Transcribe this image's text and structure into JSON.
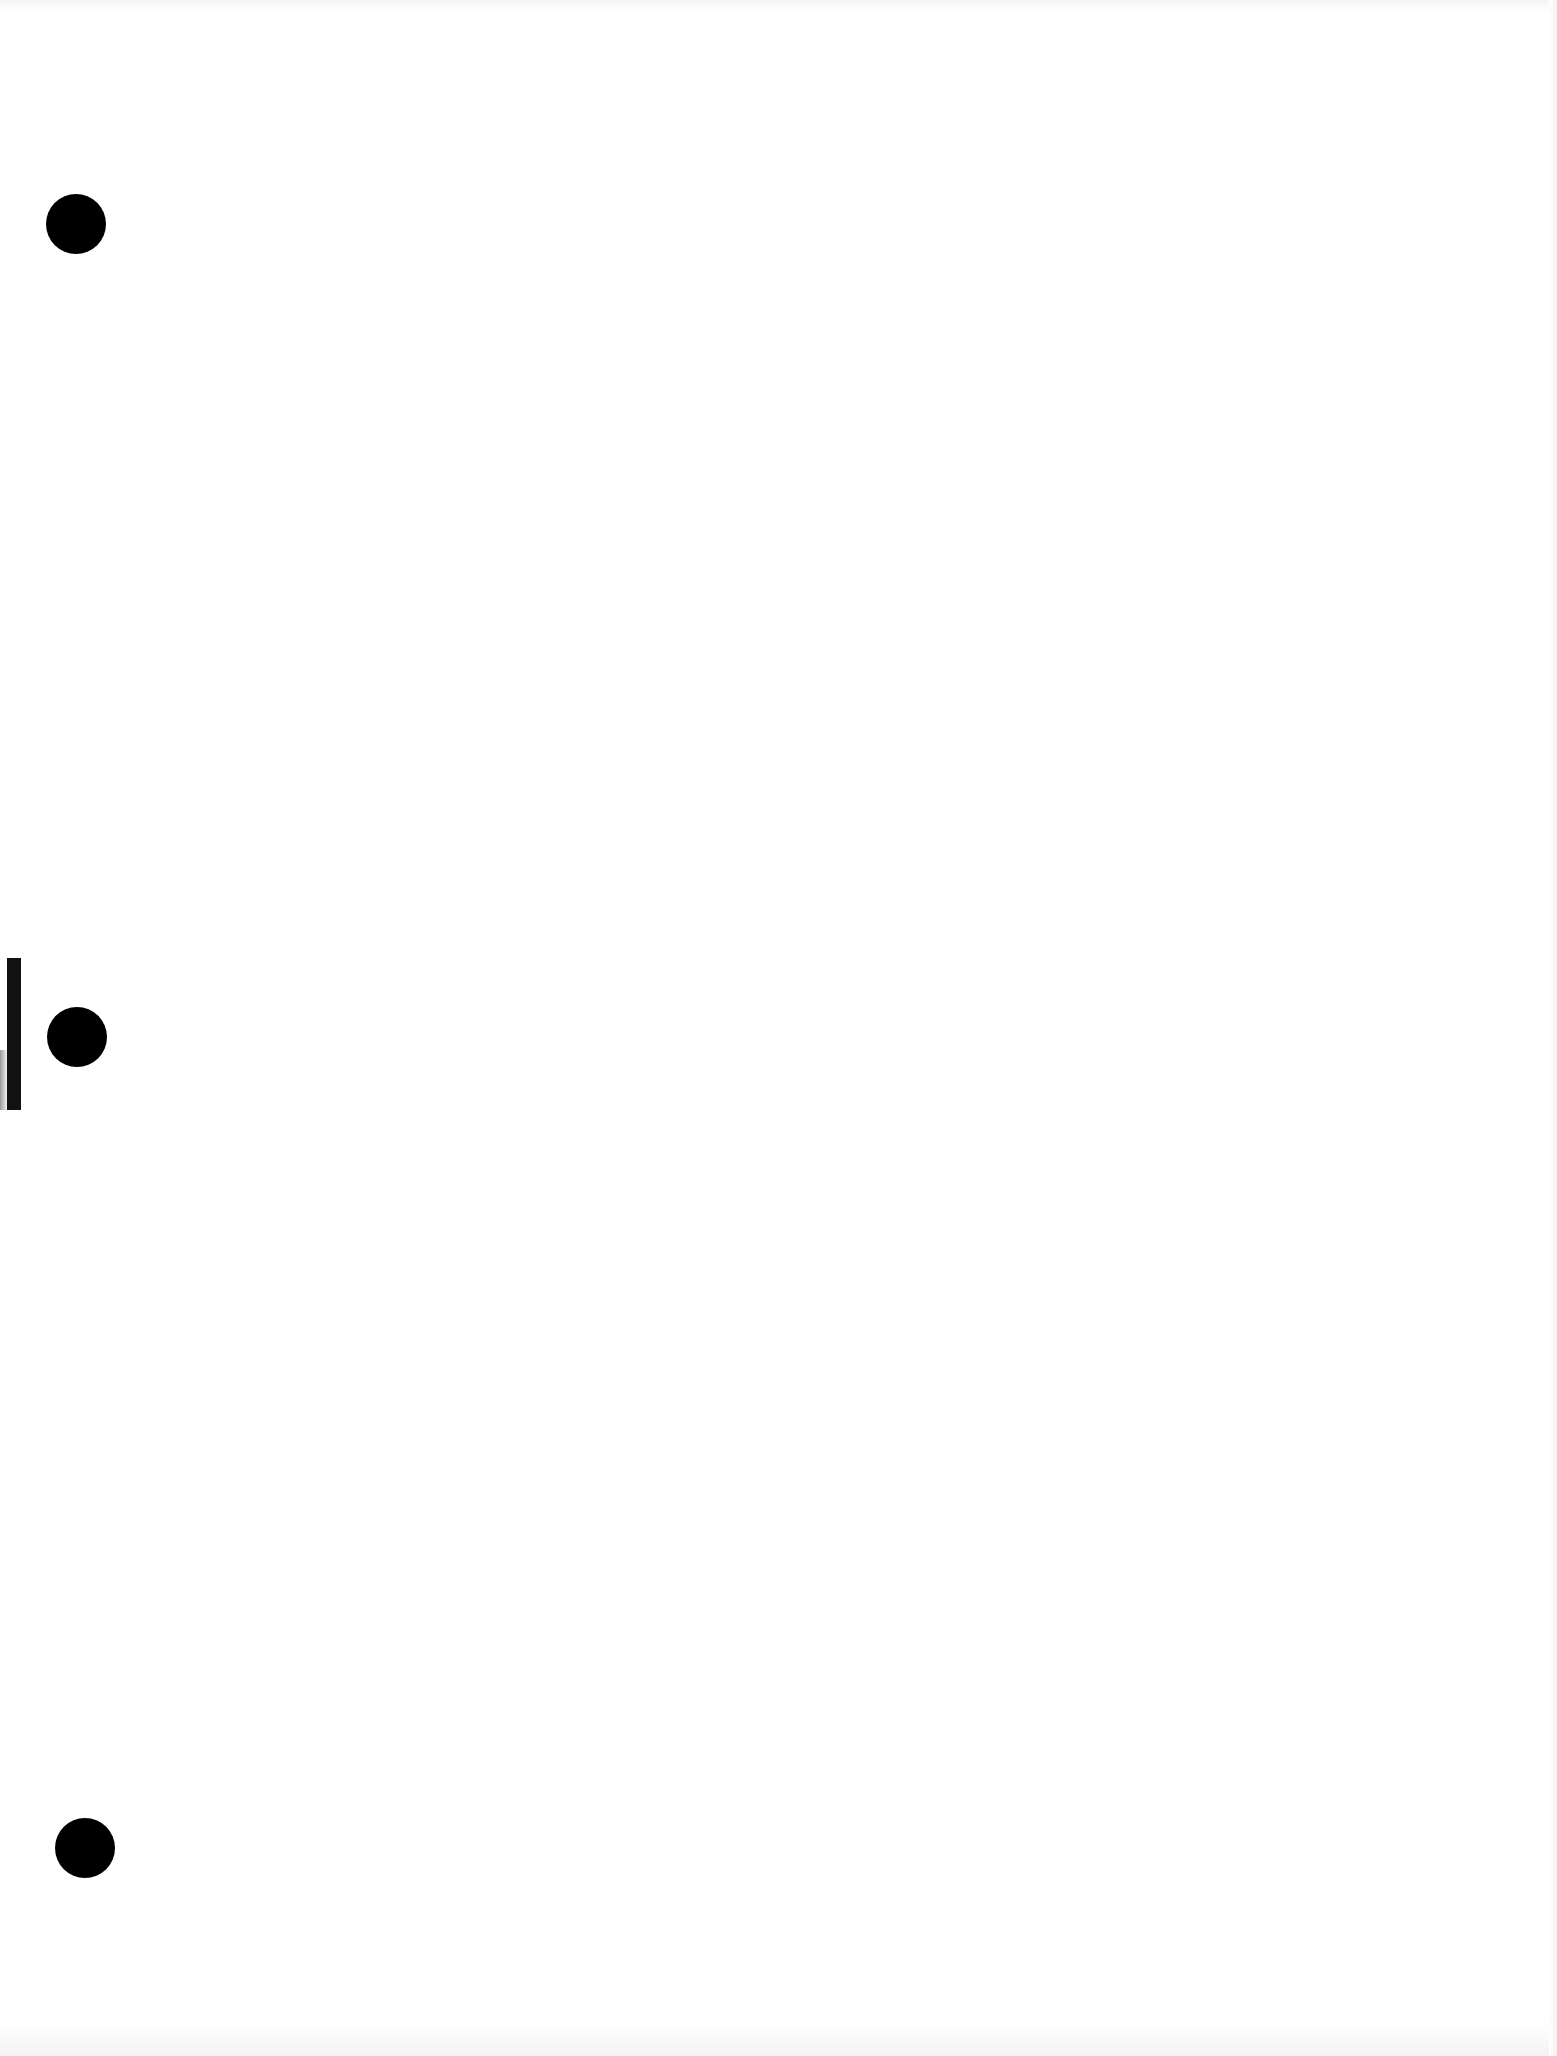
{
  "document": {
    "type": "scanned blank page",
    "background_color": "#ffffff",
    "text_content": ""
  },
  "punch_holes": [
    {
      "name": "top",
      "cx": 76,
      "cy": 224,
      "diameter": 60,
      "color": "#000000"
    },
    {
      "name": "middle",
      "cx": 77,
      "cy": 1037,
      "diameter": 60,
      "color": "#000000"
    },
    {
      "name": "bottom",
      "cx": 85,
      "cy": 1848,
      "diameter": 60,
      "color": "#000000"
    }
  ],
  "edge_mark": {
    "x": 7,
    "y": 958,
    "width": 14,
    "height": 152,
    "color": "#111111"
  }
}
